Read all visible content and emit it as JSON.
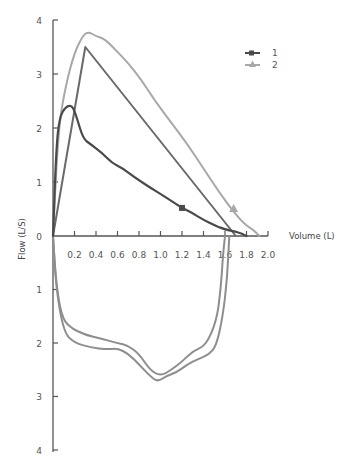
{
  "chart_data": {
    "type": "line",
    "title": "",
    "xlabel": "Volume (L)",
    "ylabel": "Flow (L/S)",
    "xlim": [
      0,
      2.0
    ],
    "ylim_expiratory": [
      0,
      4
    ],
    "ylim_inspiratory": [
      0,
      4
    ],
    "x_ticks": [
      "0.2",
      "0.4",
      "0.6",
      "0.8",
      "1.0",
      "1.2",
      "1.4",
      "1.6",
      "1.8",
      "2.0"
    ],
    "y_ticks_upper": [
      "0",
      "1",
      "2",
      "3",
      "4"
    ],
    "y_ticks_lower": [
      "1",
      "2",
      "3",
      "4"
    ],
    "grid": false,
    "legend_position": "top-right",
    "legend": [
      {
        "label": "1",
        "marker": "square",
        "color": "#4a4a4a"
      },
      {
        "label": "2",
        "marker": "triangle",
        "color": "#a8a8a8"
      }
    ],
    "series": [
      {
        "name": "1",
        "description": "Expiratory flow-volume curve 1 (dark, square marker)",
        "color": "#4a4a4a",
        "points": [
          [
            0.0,
            0.0
          ],
          [
            0.03,
            1.6
          ],
          [
            0.06,
            2.2
          ],
          [
            0.12,
            2.4
          ],
          [
            0.18,
            2.42
          ],
          [
            0.22,
            2.2
          ],
          [
            0.28,
            1.8
          ],
          [
            0.35,
            1.7
          ],
          [
            0.45,
            1.55
          ],
          [
            0.55,
            1.35
          ],
          [
            0.65,
            1.25
          ],
          [
            0.75,
            1.1
          ],
          [
            0.9,
            0.9
          ],
          [
            1.0,
            0.78
          ],
          [
            1.1,
            0.65
          ],
          [
            1.2,
            0.52
          ],
          [
            1.3,
            0.42
          ],
          [
            1.4,
            0.3
          ],
          [
            1.5,
            0.2
          ],
          [
            1.6,
            0.12
          ],
          [
            1.7,
            0.08
          ],
          [
            1.76,
            0.04
          ],
          [
            1.8,
            0.0
          ]
        ]
      },
      {
        "name": "2",
        "description": "Expiratory flow-volume curve 2 (light, triangle marker)",
        "color": "#a8a8a8",
        "points": [
          [
            0.0,
            0.0
          ],
          [
            0.05,
            2.0
          ],
          [
            0.12,
            2.8
          ],
          [
            0.2,
            3.4
          ],
          [
            0.28,
            3.72
          ],
          [
            0.33,
            3.78
          ],
          [
            0.4,
            3.7
          ],
          [
            0.48,
            3.65
          ],
          [
            0.58,
            3.45
          ],
          [
            0.7,
            3.2
          ],
          [
            0.82,
            2.9
          ],
          [
            0.95,
            2.5
          ],
          [
            1.1,
            2.1
          ],
          [
            1.25,
            1.7
          ],
          [
            1.4,
            1.25
          ],
          [
            1.55,
            0.8
          ],
          [
            1.68,
            0.45
          ],
          [
            1.78,
            0.22
          ],
          [
            1.86,
            0.12
          ],
          [
            1.92,
            0.0
          ]
        ]
      },
      {
        "name": "triangle-reference",
        "description": "Idealised triangular expiratory curve (dark grey)",
        "color": "#6a6a6a",
        "points": [
          [
            0.0,
            0.0
          ],
          [
            0.3,
            3.5
          ],
          [
            1.7,
            0.0
          ]
        ]
      },
      {
        "name": "inspiratory-1",
        "description": "Inspiratory limb (lower, outer)",
        "color": "#8e8e8e",
        "points": [
          [
            0.0,
            0.0
          ],
          [
            0.03,
            0.9
          ],
          [
            0.08,
            1.5
          ],
          [
            0.15,
            1.7
          ],
          [
            0.3,
            1.85
          ],
          [
            0.45,
            1.92
          ],
          [
            0.6,
            2.0
          ],
          [
            0.7,
            2.05
          ],
          [
            0.8,
            2.2
          ],
          [
            0.9,
            2.5
          ],
          [
            1.0,
            2.62
          ],
          [
            1.1,
            2.5
          ],
          [
            1.2,
            2.35
          ],
          [
            1.3,
            2.15
          ],
          [
            1.42,
            2.05
          ],
          [
            1.52,
            1.6
          ],
          [
            1.56,
            1.0
          ],
          [
            1.58,
            0.4
          ],
          [
            1.6,
            0.0
          ]
        ]
      },
      {
        "name": "inspiratory-2",
        "description": "Inspiratory limb (lower, inner)",
        "color": "#8e8e8e",
        "points": [
          [
            0.0,
            0.0
          ],
          [
            0.03,
            1.0
          ],
          [
            0.1,
            1.8
          ],
          [
            0.2,
            2.0
          ],
          [
            0.35,
            2.08
          ],
          [
            0.5,
            2.12
          ],
          [
            0.6,
            2.1
          ],
          [
            0.7,
            2.2
          ],
          [
            0.8,
            2.4
          ],
          [
            0.92,
            2.65
          ],
          [
            0.98,
            2.72
          ],
          [
            1.05,
            2.62
          ],
          [
            1.15,
            2.55
          ],
          [
            1.25,
            2.4
          ],
          [
            1.35,
            2.3
          ],
          [
            1.45,
            2.22
          ],
          [
            1.52,
            2.05
          ],
          [
            1.58,
            1.5
          ],
          [
            1.62,
            0.8
          ],
          [
            1.64,
            0.0
          ]
        ]
      }
    ],
    "markers": [
      {
        "series": "1",
        "shape": "square",
        "x": 1.2,
        "y": 0.52
      },
      {
        "series": "2",
        "shape": "triangle",
        "x": 1.68,
        "y": 0.5
      }
    ]
  }
}
